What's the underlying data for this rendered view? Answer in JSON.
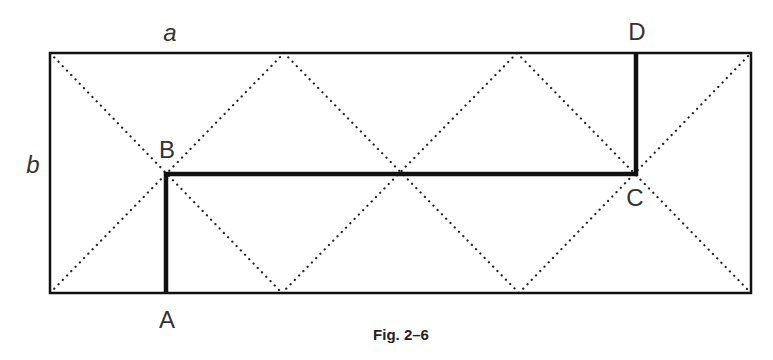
{
  "figure": {
    "caption": "Fig. 2–6",
    "dimension_labels": {
      "width": "a",
      "height": "b"
    },
    "points": {
      "A": {
        "label": "A",
        "x": 166,
        "y": 293
      },
      "B": {
        "label": "B",
        "x": 166,
        "y": 174
      },
      "C": {
        "label": "C",
        "x": 636,
        "y": 174
      },
      "D": {
        "label": "D",
        "x": 636,
        "y": 53
      }
    },
    "rectangle": {
      "x": 50,
      "y": 53,
      "width": 701,
      "height": 240
    },
    "path": [
      "A",
      "B",
      "C",
      "D"
    ],
    "dotted_zigzag_top_vertices_x": [
      50,
      284,
      517,
      751
    ],
    "dotted_zigzag_bottom_vertices_x": [
      50,
      282,
      519,
      751
    ],
    "colors": {
      "line": "#111111",
      "dots": "#222222",
      "text": "#333333"
    }
  }
}
